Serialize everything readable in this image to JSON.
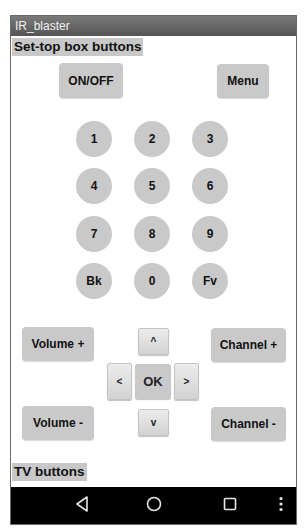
{
  "app": {
    "title": "IR_blaster"
  },
  "sections": {
    "settop_label": "Set-top box buttons",
    "tv_label": "TV buttons"
  },
  "settop": {
    "power": "ON/OFF",
    "menu": "Menu",
    "keypad": [
      "1",
      "2",
      "3",
      "4",
      "5",
      "6",
      "7",
      "8",
      "9",
      "Bk",
      "0",
      "Fv"
    ],
    "volume_up": "Volume +",
    "volume_down": "Volume -",
    "channel_up": "Channel +",
    "channel_down": "Channel -",
    "dpad": {
      "up": "^",
      "left": "<",
      "ok": "OK",
      "right": ">",
      "down": "v"
    }
  },
  "navbar": {
    "icons": [
      "back-icon",
      "home-icon",
      "recents-icon",
      "overflow-menu-icon"
    ]
  },
  "colors": {
    "titlebar": "#5e5e5e",
    "button": "#c9c9c9",
    "navbar": "#000000"
  }
}
